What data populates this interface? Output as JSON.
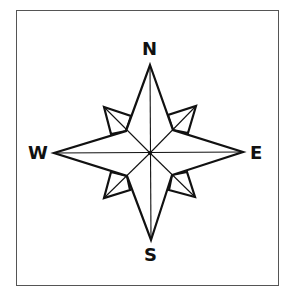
{
  "diagram": {
    "type": "compass-rose",
    "labels": {
      "north": "N",
      "south": "S",
      "east": "E",
      "west": "W"
    },
    "colors": {
      "stroke": "#111111",
      "frame": "#555555",
      "fill": "#ffffff"
    }
  }
}
